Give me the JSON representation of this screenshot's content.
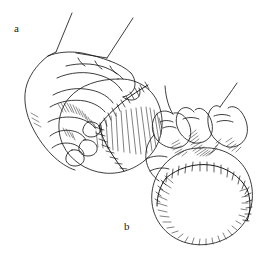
{
  "figure": {
    "background_color": "#ffffff",
    "ink_color": "#1a1a1a",
    "width": 263,
    "height": 254
  },
  "panels": [
    {
      "id": "a",
      "label": "a",
      "caption": "a",
      "view": "three-quarter side view of hand gripping baseball",
      "label_x": 14,
      "label_y": 23,
      "leader_lines": 2
    },
    {
      "id": "b",
      "label": "b",
      "caption": "b",
      "view": "front view of fingers gripping baseball across the seams",
      "label_x": 124,
      "label_y": 221,
      "leader_lines": 2
    }
  ],
  "elements": {
    "panel_a_ball": "baseball-outline-a",
    "panel_a_hand": "hand-outline-a",
    "panel_a_seam": "baseball-seam-a",
    "panel_b_ball": "baseball-outline-b",
    "panel_b_hand": "hand-outline-b",
    "panel_b_seam": "baseball-seam-b"
  }
}
